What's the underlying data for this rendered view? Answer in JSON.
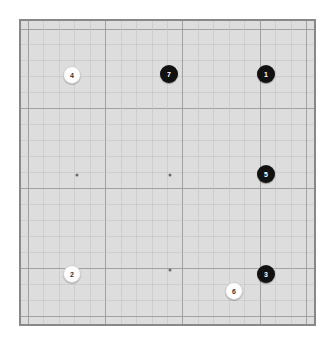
{
  "board": {
    "name": "go-board",
    "size": 19,
    "background_color": "#dddddd",
    "border_color": "#888888",
    "minor_line_color": "#c4c4c4",
    "major_line_color": "#9a9a9a",
    "page_background": "#ffffff",
    "pixel_width": 297,
    "pixel_height": 307,
    "offset_x": 19,
    "offset_y": 19,
    "cell_width": 15.2,
    "cell_height": 15.7,
    "margin_x": 7.5,
    "margin_y": 8.0,
    "major_line_interval": 5
  },
  "star_points": [
    {
      "name": "star-point-left-center",
      "col": 3,
      "row": 9
    },
    {
      "name": "star-point-center",
      "col": 9,
      "row": 9
    },
    {
      "name": "star-point-bottom-center",
      "col": 9,
      "row": 15
    }
  ],
  "stones": [
    {
      "name": "stone-1",
      "label": "1",
      "color": "black",
      "color_hex": "#111111",
      "text_color": "#ffffff",
      "col": 16,
      "row": 3,
      "cx": 266,
      "cy": 74,
      "radius": 9
    },
    {
      "name": "stone-2",
      "label": "2",
      "color": "white",
      "color_hex": "#fdfdfd",
      "text_color": "#333333",
      "col": 3,
      "row": 16,
      "cx": 72,
      "cy": 274,
      "radius": 9
    },
    {
      "name": "stone-3",
      "label": "3",
      "color": "black",
      "color_hex": "#111111",
      "text_color": "#ffffff",
      "col": 16,
      "row": 16,
      "cx": 266,
      "cy": 274,
      "radius": 9
    },
    {
      "name": "stone-4",
      "label": "4",
      "color": "white",
      "color_hex": "#fdfdfd",
      "text_color": "#333333",
      "col": 3,
      "row": 3,
      "cx": 72,
      "cy": 75,
      "radius": 9
    },
    {
      "name": "stone-5",
      "label": "5",
      "color": "black",
      "color_hex": "#111111",
      "text_color": "#ffffff",
      "col": 16,
      "row": 9,
      "cx": 266,
      "cy": 174,
      "radius": 9
    },
    {
      "name": "stone-6",
      "label": "6",
      "color": "white",
      "color_hex": "#fdfdfd",
      "text_color": "#333333",
      "col": 14,
      "row": 17,
      "cx": 234,
      "cy": 291,
      "radius": 9
    },
    {
      "name": "stone-7",
      "label": "7",
      "color": "black",
      "color_hex": "#111111",
      "text_color": "#ffffff",
      "col": 9,
      "row": 3,
      "cx": 169,
      "cy": 74,
      "radius": 9
    }
  ]
}
